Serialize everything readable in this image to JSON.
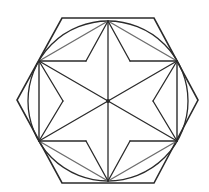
{
  "diagram": {
    "canvas": {
      "width": 209,
      "height": 192,
      "background": "#ffffff"
    },
    "colors": {
      "stroke": "#2b2b2b",
      "chord_stroke": "#6e6e6e"
    },
    "center": [
      108,
      101
    ],
    "outer_hexagon": [
      [
        62,
        18
      ],
      [
        154,
        18
      ],
      [
        198,
        100
      ],
      [
        154,
        183
      ],
      [
        62,
        183
      ],
      [
        17,
        100
      ]
    ],
    "circle": {
      "cx": 108,
      "cy": 101,
      "r": 80
    },
    "inscribed_hexagon": [
      [
        108,
        21
      ],
      [
        177,
        61
      ],
      [
        177,
        141
      ],
      [
        108,
        181
      ],
      [
        39,
        141
      ],
      [
        39,
        61
      ]
    ],
    "inner_star_points": [
      [
        86,
        61
      ],
      [
        130,
        61
      ],
      [
        153,
        101
      ],
      [
        130,
        141
      ],
      [
        86,
        141
      ],
      [
        63,
        101
      ]
    ]
  }
}
